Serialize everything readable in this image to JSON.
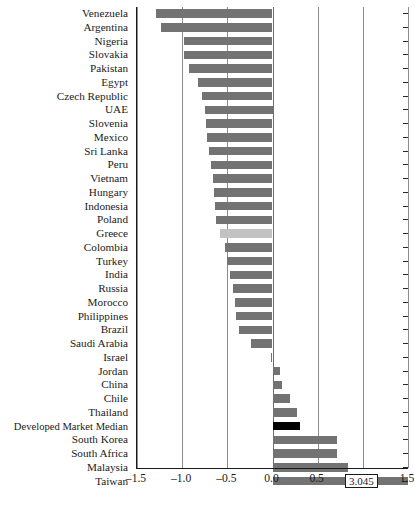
{
  "chart_data": {
    "type": "bar",
    "orientation": "horizontal",
    "title": "",
    "xlabel": "",
    "ylabel": "",
    "xlim": [
      -1.5,
      1.5
    ],
    "xticks": [
      -1.5,
      -1.0,
      -0.5,
      0.0,
      0.5,
      1.0,
      1.5
    ],
    "xticklabels": [
      "–1.5",
      "–1.0",
      "–0.5",
      "0.0",
      "0.5",
      "1.0",
      "1.5"
    ],
    "grid": true,
    "legend": null,
    "categories": [
      "Venezuela",
      "Argentina",
      "Nigeria",
      "Slovakia",
      "Pakistan",
      "Egypt",
      "Czech Republic",
      "UAE",
      "Slovenia",
      "Mexico",
      "Sri Lanka",
      "Peru",
      "Vietnam",
      "Hungary",
      "Indonesia",
      "Poland",
      "Greece",
      "Colombia",
      "Turkey",
      "India",
      "Russia",
      "Morocco",
      "Philippines",
      "Brazil",
      "Saudi Arabia",
      "Israel",
      "Jordan",
      "China",
      "Chile",
      "Thailand",
      "Developed Market Median",
      "South Korea",
      "South Africa",
      "Malaysia",
      "Taiwan"
    ],
    "values": [
      -1.29,
      -1.23,
      -0.98,
      -0.98,
      -0.92,
      -0.83,
      -0.78,
      -0.75,
      -0.74,
      -0.72,
      -0.7,
      -0.68,
      -0.66,
      -0.65,
      -0.64,
      -0.63,
      -0.58,
      -0.53,
      -0.5,
      -0.47,
      -0.44,
      -0.42,
      -0.4,
      -0.37,
      -0.24,
      -0.02,
      0.08,
      0.1,
      0.19,
      0.27,
      0.3,
      0.71,
      0.71,
      0.84,
      3.045
    ],
    "bar_styles": {
      "default": "#737373",
      "highlight_light": "#c2c2c2",
      "highlight_dark": "#000000"
    },
    "highlighted": {
      "Greece": "highlight_light",
      "Developed Market Median": "highlight_dark"
    },
    "annotations": [
      {
        "category": "Taiwan",
        "text": "3.045",
        "note": "value extends beyond axis maximum"
      }
    ]
  },
  "caption": ""
}
